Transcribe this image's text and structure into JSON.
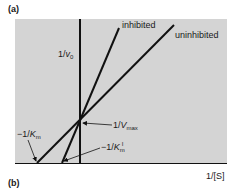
{
  "figure": {
    "panel_a_label": "(a)",
    "panel_b_label": "(b)",
    "type": "Lineweaver-Burk double reciprocal plot",
    "background_color": "#d4d4d4",
    "line_color": "#111111"
  },
  "axes": {
    "y_label_prefix": "1/",
    "y_label_var": "v",
    "y_label_sub": "0",
    "x_label": "1/[S]"
  },
  "lines": [
    {
      "name": "inhibited",
      "label": "inhibited",
      "x_intercept_label": "−1/K′m"
    },
    {
      "name": "uninhibited",
      "label": "uninhibited",
      "x_intercept_label": "−1/Km"
    }
  ],
  "annotations": {
    "y_intercept": {
      "prefix": "1/",
      "var": "V",
      "sub": "max"
    },
    "km": {
      "prefix": "−1/",
      "var": "K",
      "sub": "m"
    },
    "km_prime": {
      "prefix": "−1/",
      "var": "K",
      "sub": "m",
      "sup": "I"
    }
  }
}
